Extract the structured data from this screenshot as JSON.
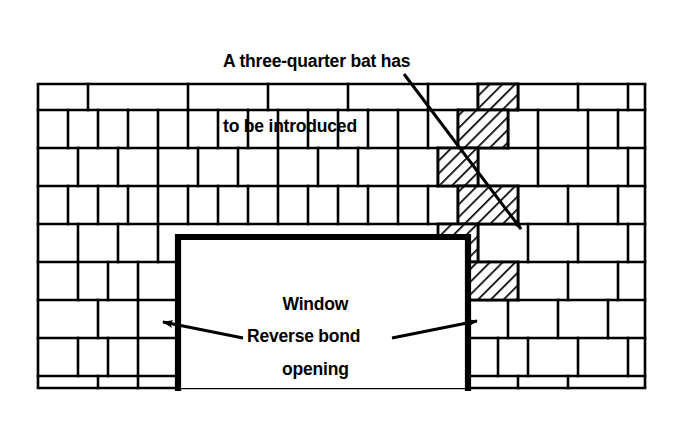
{
  "figure": {
    "background_color": "#ffffff",
    "line_color": "#000000"
  },
  "annotations": {
    "three_quarter_bat": {
      "line1": "A three-quarter bat has",
      "line2": "to be introduced",
      "text": "A three-quarter bat has to be introduced",
      "arrow": {
        "from_x": 404,
        "from_y": 74,
        "to_x": 521,
        "to_y": 229
      }
    },
    "window_opening": {
      "line1": "Window",
      "line2": "opening",
      "text": "Window opening"
    },
    "reverse_bond": {
      "text": "Reverse bond",
      "left_arrow": {
        "from_x": 243,
        "from_y": 338,
        "to_x": 163,
        "to_y": 322
      },
      "right_arrow": {
        "from_x": 392,
        "from_y": 338,
        "to_x": 477,
        "to_y": 321
      }
    }
  },
  "wall": {
    "left": 38,
    "right": 645,
    "top": 84,
    "bottom": 388,
    "hatch_color": "#000000",
    "hatch_label": "three-quarter bat",
    "window": {
      "left": 178,
      "right": 468,
      "top": 237,
      "bottom": 388
    },
    "course_y": [
      84,
      110,
      122,
      148,
      160,
      186,
      198,
      224,
      237,
      262,
      275,
      300,
      313,
      338,
      351,
      376,
      388
    ],
    "courses": [
      {
        "name": "course-1-stretcher",
        "y0": 84,
        "y1": 110,
        "joints": [
          88,
          188,
          268,
          348,
          428,
          478,
          518,
          578,
          628
        ],
        "hatched": [
          [
            478,
            518
          ]
        ]
      },
      {
        "name": "course-2-header",
        "y0": 110,
        "y1": 148,
        "joints": [
          68,
          98,
          128,
          158,
          188,
          218,
          248,
          278,
          308,
          338,
          368,
          398,
          428,
          458,
          508,
          538,
          588,
          618
        ],
        "hatched": [
          [
            458,
            508
          ]
        ]
      },
      {
        "name": "course-3-stretcher",
        "y0": 148,
        "y1": 186,
        "joints": [
          78,
          118,
          158,
          198,
          238,
          278,
          318,
          358,
          398,
          438,
          478,
          538,
          588,
          628
        ],
        "hatched": [
          [
            438,
            478
          ]
        ]
      },
      {
        "name": "course-4-header",
        "y0": 186,
        "y1": 224,
        "joints": [
          68,
          98,
          128,
          158,
          188,
          218,
          248,
          278,
          308,
          338,
          368,
          398,
          428,
          458,
          518,
          568,
          618
        ],
        "hatched": [
          [
            458,
            518
          ]
        ]
      },
      {
        "name": "course-5-stretcher",
        "y0": 224,
        "y1": 262,
        "joints": [
          78,
          118,
          158,
          198,
          238,
          278,
          318,
          358,
          398,
          438,
          478,
          528,
          578,
          628
        ],
        "hatched": [
          [
            438,
            478
          ]
        ]
      },
      {
        "name": "course-6-mixed",
        "y0": 262,
        "y1": 300,
        "joints": [
          78,
          108,
          138,
          488,
          518,
          568,
          618
        ],
        "hatched": [
          [
            468,
            518
          ]
        ]
      },
      {
        "name": "course-7",
        "y0": 300,
        "y1": 338,
        "joints": [
          98,
          138,
          508,
          558,
          608
        ],
        "hatched": []
      },
      {
        "name": "course-8",
        "y0": 338,
        "y1": 376,
        "joints": [
          78,
          108,
          138,
          498,
          528,
          578,
          628
        ],
        "hatched": []
      },
      {
        "name": "course-9",
        "y0": 376,
        "y1": 388,
        "joints": [
          98,
          138,
          518,
          568
        ],
        "hatched": []
      }
    ]
  }
}
